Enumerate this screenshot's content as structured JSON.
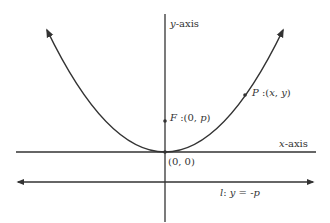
{
  "diagram": {
    "colors": {
      "stroke": "#333333",
      "text": "#333333",
      "background": "#ffffff"
    },
    "labels": {
      "y_axis": {
        "var": "y",
        "rest": "-axis"
      },
      "x_axis": {
        "var": "x",
        "rest": "-axis"
      },
      "focus": {
        "name": "F",
        "sep": " :(",
        "coords": "0, ",
        "p": "p",
        "close": ")"
      },
      "point": {
        "name": "P",
        "sep": " :(",
        "x": "x",
        "comma": ", ",
        "y": "y",
        "close": ")"
      },
      "origin": "(0, 0)",
      "directrix": {
        "name": "l",
        "sep": ": ",
        "lhs": "y",
        "eq": " = -",
        "rhs": "p"
      }
    },
    "geometry": {
      "origin_px": [
        165,
        152
      ],
      "focus_px": [
        165,
        121
      ],
      "point_px": [
        245,
        95
      ],
      "directrix_y_px": 182
    }
  }
}
